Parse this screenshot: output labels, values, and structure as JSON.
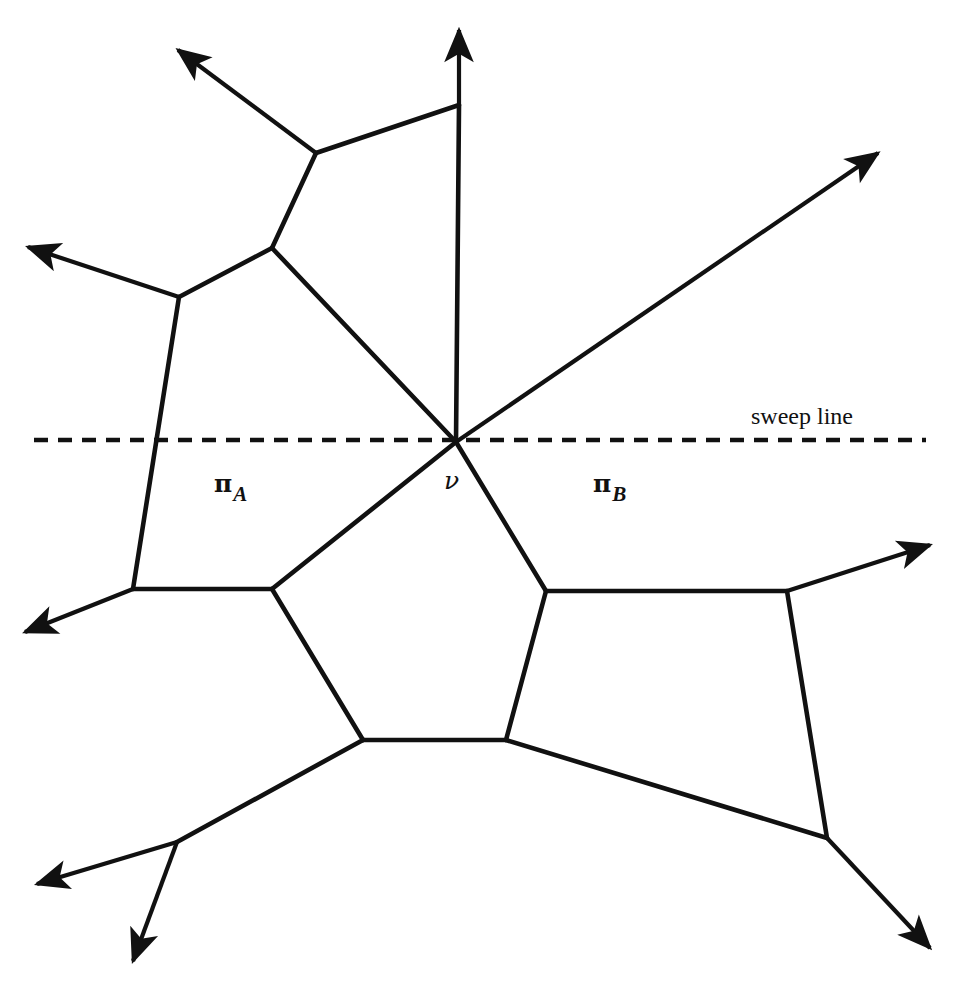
{
  "figure": {
    "title": "",
    "background_color": "#ffffff",
    "stroke_color": "#111111",
    "canvas": {
      "width": 960,
      "height": 989
    }
  },
  "labels": {
    "region_a": {
      "symbol": "π",
      "subscript": "A",
      "x": 214,
      "y": 468
    },
    "region_b": {
      "symbol": "π",
      "subscript": "B",
      "x": 593,
      "y": 468
    },
    "vertex": {
      "text": "ν",
      "x": 444,
      "y": 466
    },
    "sweep_line": {
      "text": "sweep line",
      "x": 751,
      "y": 403
    }
  },
  "sweep_line": {
    "y": 440,
    "x_start": 34,
    "x_end": 926,
    "style": "dashed",
    "dash": "14 10",
    "width": 4.5,
    "color": "#111111"
  },
  "chart_data": {
    "type": "diagram",
    "subtype": "planar-subdivision-sweep",
    "vertices": [
      {
        "id": "t",
        "x": 459,
        "y": 105
      },
      {
        "id": "a",
        "x": 316,
        "y": 153
      },
      {
        "id": "b",
        "x": 272,
        "y": 248
      },
      {
        "id": "c",
        "x": 179,
        "y": 297
      },
      {
        "id": "v",
        "x": 456,
        "y": 442
      },
      {
        "id": "d",
        "x": 133,
        "y": 589
      },
      {
        "id": "e",
        "x": 272,
        "y": 589
      },
      {
        "id": "f",
        "x": 546,
        "y": 591
      },
      {
        "id": "g",
        "x": 787,
        "y": 591
      },
      {
        "id": "h",
        "x": 363,
        "y": 740
      },
      {
        "id": "i",
        "x": 506,
        "y": 740
      },
      {
        "id": "j",
        "x": 827,
        "y": 838
      },
      {
        "id": "k",
        "x": 177,
        "y": 842
      }
    ],
    "ray_tips": [
      {
        "id": "r_top",
        "x": 459,
        "y": 30
      },
      {
        "id": "r_upleft",
        "x": 178,
        "y": 50
      },
      {
        "id": "r_left_upper",
        "x": 28,
        "y": 247
      },
      {
        "id": "r_upright",
        "x": 878,
        "y": 153
      },
      {
        "id": "r_left_mid",
        "x": 25,
        "y": 632
      },
      {
        "id": "r_right_mid",
        "x": 930,
        "y": 545
      },
      {
        "id": "r_left_low",
        "x": 37,
        "y": 884
      },
      {
        "id": "r_down_low",
        "x": 133,
        "y": 961
      },
      {
        "id": "r_downright",
        "x": 930,
        "y": 948
      }
    ],
    "edges": [
      {
        "from": "a",
        "to": "t",
        "arrow": false
      },
      {
        "from": "a",
        "to": "b",
        "arrow": false
      },
      {
        "from": "b",
        "to": "c",
        "arrow": false
      },
      {
        "from": "c",
        "to": "d",
        "arrow": false
      },
      {
        "from": "t",
        "to": "v",
        "arrow": false
      },
      {
        "from": "b",
        "to": "v",
        "arrow": false
      },
      {
        "from": "d",
        "to": "e",
        "arrow": false
      },
      {
        "from": "e",
        "to": "v",
        "arrow": false
      },
      {
        "from": "v",
        "to": "f",
        "arrow": false
      },
      {
        "from": "e",
        "to": "h",
        "arrow": false
      },
      {
        "from": "h",
        "to": "i",
        "arrow": false
      },
      {
        "from": "i",
        "to": "f",
        "arrow": false
      },
      {
        "from": "f",
        "to": "g",
        "arrow": false
      },
      {
        "from": "i",
        "to": "j",
        "arrow": false
      },
      {
        "from": "g",
        "to": "j",
        "arrow": false
      },
      {
        "from": "h",
        "to": "k",
        "arrow": false
      },
      {
        "from": "v",
        "to": "r_upright",
        "arrow": true
      },
      {
        "from": "a",
        "to": "r_upleft",
        "arrow": true
      },
      {
        "from": "t",
        "to": "r_top",
        "arrow": true
      },
      {
        "from": "c",
        "to": "r_left_upper",
        "arrow": true
      },
      {
        "from": "d",
        "to": "r_left_mid",
        "arrow": true
      },
      {
        "from": "g",
        "to": "r_right_mid",
        "arrow": true
      },
      {
        "from": "k",
        "to": "r_left_low",
        "arrow": true
      },
      {
        "from": "k",
        "to": "r_down_low",
        "arrow": true
      },
      {
        "from": "j",
        "to": "r_downright",
        "arrow": true
      }
    ],
    "crossings": [
      {
        "x": 645,
        "y": 348,
        "note": "edge t-v crosses ray v->upright extension"
      }
    ],
    "regions": [
      {
        "label": "πA",
        "centroid": {
          "x": 225,
          "y": 480
        }
      },
      {
        "label": "πB",
        "centroid": {
          "x": 605,
          "y": 480
        }
      }
    ],
    "xlabel": "",
    "ylabel": "",
    "grid": false,
    "legend": "none"
  }
}
